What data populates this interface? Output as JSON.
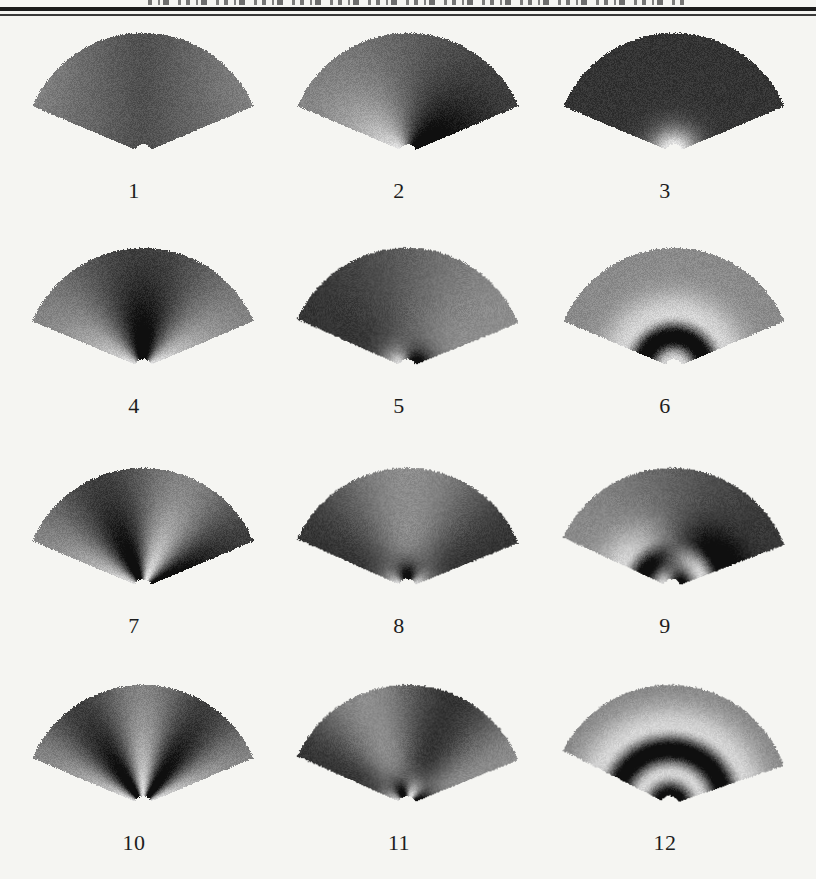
{
  "page": {
    "background_color": "#f5f5f2"
  },
  "header": {
    "cropped_text_present": true,
    "top_rule_primary_color": "#1b1b1b",
    "top_rule_secondary_color": "#3a3a3a"
  },
  "figure": {
    "geometry": {
      "span_deg": 134,
      "angle_min_deg": 23,
      "angle_max_deg": 157,
      "outer_radius_px": 120,
      "notch_radius_px": 9
    },
    "rendering": {
      "base_gray": 96,
      "contrast": 116,
      "grain": 26,
      "edge_jitter_px": 1.8
    },
    "panels": [
      {
        "label": "1",
        "angular_mode": 0,
        "radial_mode": 0,
        "appearance": "nearly uniform dark field, slightly lighter lower corners, small apex notch"
      },
      {
        "label": "2",
        "angular_mode": 1,
        "radial_mode": 0,
        "appearance": "bright left half strongest near apex, dark right half, vertical nodal line"
      },
      {
        "label": "3",
        "angular_mode": 0,
        "radial_mode": 1,
        "appearance": "bright semicircular core at apex, uniformly dark outer field"
      },
      {
        "label": "4",
        "angular_mode": 2,
        "radial_mode": 0,
        "appearance": "dark central wedge with bright flanking lobes near apex"
      },
      {
        "label": "5",
        "angular_mode": 1,
        "radial_mode": 1,
        "appearance": "dark left half with bright apex core, lighter right half with dark apex sector"
      },
      {
        "label": "6",
        "angular_mode": 0,
        "radial_mode": 2,
        "appearance": "medium gray field with dark annular band around bright apex notch"
      },
      {
        "label": "7",
        "angular_mode": 3,
        "radial_mode": 0,
        "appearance": "alternating bright and dark wedges, bright lobes at lower-left and right of center"
      },
      {
        "label": "8",
        "angular_mode": 2,
        "radial_mode": 1,
        "appearance": "light central column at mid radius, dark apex wedge flanked by bright arcs, dark sides"
      },
      {
        "label": "9",
        "angular_mode": 1,
        "radial_mode": 2,
        "appearance": "light left half and dark right half with opposite-phase arc bands at apex"
      },
      {
        "label": "10",
        "angular_mode": 4,
        "radial_mode": 0,
        "appearance": "narrow bright central streak, dark wedges, light outer edge lobes"
      },
      {
        "label": "11",
        "angular_mode": 3,
        "radial_mode": 1,
        "appearance": "alternating wedges with alternating bright/dark arc segments at apex"
      },
      {
        "label": "12",
        "angular_mode": 0,
        "radial_mode": 3,
        "appearance": "concentric arcs at apex: dark core, bright band, dark band, light band, gray outer"
      }
    ]
  }
}
